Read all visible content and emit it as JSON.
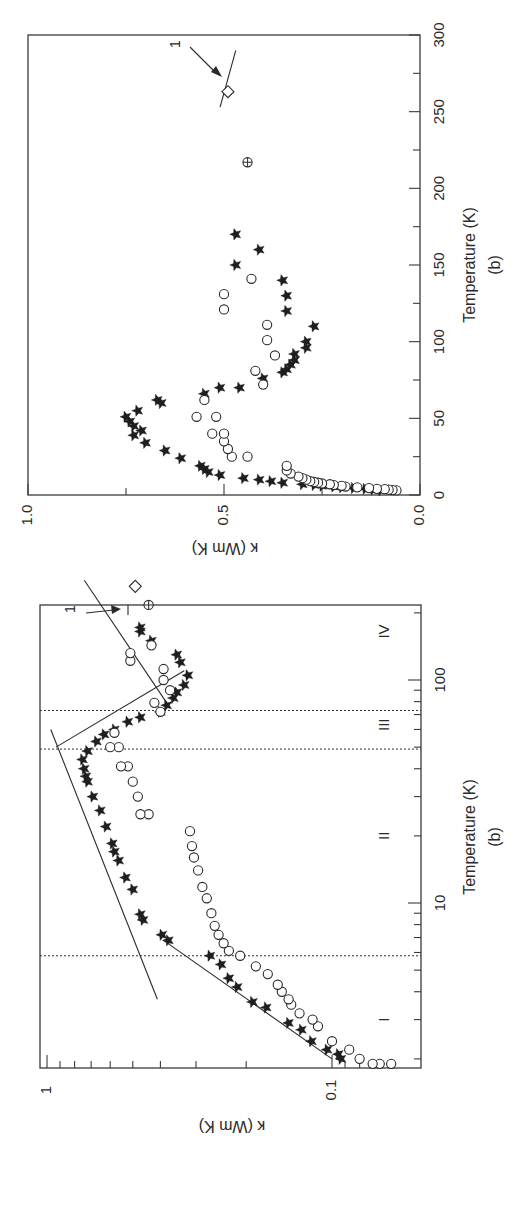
{
  "figure": {
    "orientation": "rotated 90 degrees counter-clockwise",
    "background": "#ffffff",
    "ink": "#2a2a2a"
  },
  "chart_data": [
    {
      "id": "linear-plot",
      "type": "scatter",
      "title": "",
      "panel_label": "(b)",
      "xlabel": "Temperature (K)",
      "ylabel": "κ (Wm K)",
      "xlim": [
        0,
        300
      ],
      "ylim": [
        0.0,
        1.0
      ],
      "x_ticks": [
        0,
        50,
        100,
        150,
        200,
        250,
        300
      ],
      "x_tick_labels": [
        "0",
        "50",
        "100",
        "150",
        "200",
        "250",
        "300"
      ],
      "x_minor_ticks": [
        25,
        75,
        125,
        175,
        225,
        275
      ],
      "y_ticks": [
        0.0,
        0.5,
        1.0
      ],
      "y_tick_labels": [
        "0.0",
        "0.5",
        "1.0"
      ],
      "y_minor_ticks": [
        0.25,
        0.75
      ],
      "grid": false,
      "series": [
        {
          "name": "stars",
          "marker": "filled-star",
          "points": [
            [
              3,
              0.1
            ],
            [
              3.5,
              0.12
            ],
            [
              4,
              0.14
            ],
            [
              4.5,
              0.17
            ],
            [
              5,
              0.2
            ],
            [
              5.5,
              0.22
            ],
            [
              6,
              0.25
            ],
            [
              6.5,
              0.27
            ],
            [
              7,
              0.3
            ],
            [
              8,
              0.35
            ],
            [
              9,
              0.38
            ],
            [
              10,
              0.41
            ],
            [
              11,
              0.45
            ],
            [
              13,
              0.51
            ],
            [
              15,
              0.54
            ],
            [
              17,
              0.55
            ],
            [
              19,
              0.56
            ],
            [
              24,
              0.61
            ],
            [
              29,
              0.65
            ],
            [
              34,
              0.7
            ],
            [
              39,
              0.73
            ],
            [
              42,
              0.71
            ],
            [
              45,
              0.73
            ],
            [
              48,
              0.74
            ],
            [
              51,
              0.75
            ],
            [
              55,
              0.72
            ],
            [
              60,
              0.66
            ],
            [
              62,
              0.67
            ],
            [
              66,
              0.55
            ],
            [
              70,
              0.51
            ],
            [
              70,
              0.46
            ],
            [
              76,
              0.4
            ],
            [
              80,
              0.35
            ],
            [
              82,
              0.34
            ],
            [
              85,
              0.33
            ],
            [
              88,
              0.32
            ],
            [
              92,
              0.32
            ],
            [
              96,
              0.29
            ],
            [
              100,
              0.29
            ],
            [
              110,
              0.27
            ],
            [
              120,
              0.34
            ],
            [
              130,
              0.34
            ],
            [
              140,
              0.35
            ],
            [
              150,
              0.47
            ],
            [
              160,
              0.41
            ],
            [
              170,
              0.47
            ]
          ]
        },
        {
          "name": "open circles",
          "marker": "open-circle",
          "points": [
            [
              3,
              0.06
            ],
            [
              3.2,
              0.07
            ],
            [
              3.5,
              0.08
            ],
            [
              3.8,
              0.09
            ],
            [
              4,
              0.11
            ],
            [
              4.5,
              0.13
            ],
            [
              5,
              0.16
            ],
            [
              5.5,
              0.19
            ],
            [
              6,
              0.2
            ],
            [
              6.5,
              0.22
            ],
            [
              7,
              0.23
            ],
            [
              7.5,
              0.25
            ],
            [
              8,
              0.26
            ],
            [
              8.5,
              0.27
            ],
            [
              9,
              0.28
            ],
            [
              10,
              0.29
            ],
            [
              11,
              0.3
            ],
            [
              12,
              0.31
            ],
            [
              14,
              0.33
            ],
            [
              16,
              0.34
            ],
            [
              19,
              0.34
            ],
            [
              25,
              0.44
            ],
            [
              25,
              0.48
            ],
            [
              30,
              0.49
            ],
            [
              35,
              0.5
            ],
            [
              40,
              0.53
            ],
            [
              40,
              0.5
            ],
            [
              51,
              0.52
            ],
            [
              51,
              0.57
            ],
            [
              62,
              0.55
            ],
            [
              72,
              0.4
            ],
            [
              81,
              0.42
            ],
            [
              91,
              0.37
            ],
            [
              101,
              0.39
            ],
            [
              111,
              0.39
            ],
            [
              121,
              0.5
            ],
            [
              131,
              0.5
            ],
            [
              141,
              0.43
            ]
          ]
        },
        {
          "name": "crossed circle",
          "marker": "circle-plus",
          "points": [
            [
              217,
              0.44
            ]
          ]
        },
        {
          "name": "diamond (1)",
          "marker": "open-diamond",
          "points": [
            [
              263,
              0.49
            ]
          ]
        }
      ],
      "annotations": [
        {
          "text": "1",
          "arrow_to": [
            274,
            0.49
          ],
          "note": "arrow pointing to short line at the diamond"
        }
      ],
      "reference_line": {
        "from": [
          253,
          0.51
        ],
        "to": [
          290,
          0.47
        ]
      }
    },
    {
      "id": "log-plot",
      "type": "scatter",
      "title": "",
      "panel_label": "(b)",
      "xlabel": "Temperature (K)",
      "ylabel": "κ (Wm K)",
      "xscale": "log",
      "yscale": "log",
      "xlim": [
        1.6,
        350
      ],
      "ylim": [
        0.065,
        1.05
      ],
      "x_ticks": [
        10,
        100
      ],
      "x_tick_labels": [
        "10",
        "100"
      ],
      "x_minor_ticks": [
        2,
        3,
        4,
        5,
        6,
        7,
        8,
        9,
        20,
        30,
        40,
        50,
        60,
        70,
        80,
        90,
        200
      ],
      "y_ticks": [
        0.1,
        1
      ],
      "y_tick_labels": [
        "0.1",
        "1"
      ],
      "y_minor_ticks": [
        0.08,
        0.09,
        0.2,
        0.3,
        0.4,
        0.5,
        0.6,
        0.7,
        0.8,
        0.9
      ],
      "grid": false,
      "regions": [
        {
          "label": "I",
          "T_center": 3
        },
        {
          "label": "II",
          "T_center": 20
        },
        {
          "label": "III",
          "T_center": 63
        },
        {
          "label": "IV",
          "T_center": 165
        }
      ],
      "region_boundaries_T": [
        5.8,
        49,
        73
      ],
      "fit_lines": [
        {
          "name": "region I fit",
          "from": [
            2.0,
            0.1
          ],
          "to": [
            6.8,
            0.39
          ]
        },
        {
          "name": "region II fit",
          "from": [
            3.7,
            0.41
          ],
          "to": [
            60,
            0.97
          ]
        },
        {
          "name": "region III fit",
          "from": [
            50,
            0.93
          ],
          "to": [
            110,
            0.33
          ]
        },
        {
          "name": "region IV fit",
          "from": [
            75,
            0.37
          ],
          "to": [
            280,
            0.74
          ]
        }
      ],
      "series": [
        {
          "name": "stars",
          "marker": "filled-star",
          "points": [
            [
              2.0,
              0.093
            ],
            [
              2.1,
              0.095
            ],
            [
              2.2,
              0.104
            ],
            [
              2.4,
              0.118
            ],
            [
              2.7,
              0.128
            ],
            [
              2.9,
              0.142
            ],
            [
              3.4,
              0.17
            ],
            [
              3.6,
              0.19
            ],
            [
              4.2,
              0.215
            ],
            [
              4.6,
              0.23
            ],
            [
              5.3,
              0.245
            ],
            [
              5.8,
              0.268
            ],
            [
              6.8,
              0.375
            ],
            [
              7.2,
              0.395
            ],
            [
              8.4,
              0.46
            ],
            [
              8.9,
              0.47
            ],
            [
              11.5,
              0.5
            ],
            [
              13,
              0.53
            ],
            [
              15.5,
              0.56
            ],
            [
              17,
              0.58
            ],
            [
              18.5,
              0.59
            ],
            [
              22,
              0.62
            ],
            [
              26,
              0.65
            ],
            [
              30,
              0.69
            ],
            [
              35,
              0.72
            ],
            [
              37,
              0.73
            ],
            [
              40,
              0.74
            ],
            [
              44,
              0.75
            ],
            [
              48,
              0.72
            ],
            [
              53,
              0.67
            ],
            [
              57,
              0.63
            ],
            [
              60,
              0.58
            ],
            [
              65,
              0.52
            ],
            [
              68,
              0.47
            ],
            [
              72,
              0.4
            ],
            [
              77,
              0.38
            ],
            [
              83,
              0.36
            ],
            [
              88,
              0.35
            ],
            [
              95,
              0.33
            ],
            [
              105,
              0.32
            ],
            [
              120,
              0.34
            ],
            [
              130,
              0.35
            ],
            [
              150,
              0.43
            ],
            [
              165,
              0.47
            ],
            [
              172,
              0.47
            ]
          ]
        },
        {
          "name": "open circles",
          "marker": "open-circle",
          "points": [
            [
              1.9,
              0.062
            ],
            [
              1.9,
              0.068
            ],
            [
              1.9,
              0.072
            ],
            [
              2.0,
              0.08
            ],
            [
              2.2,
              0.087
            ],
            [
              2.4,
              0.1
            ],
            [
              2.8,
              0.112
            ],
            [
              3.0,
              0.117
            ],
            [
              3.2,
              0.13
            ],
            [
              3.5,
              0.139
            ],
            [
              3.7,
              0.142
            ],
            [
              4.0,
              0.15
            ],
            [
              4.3,
              0.155
            ],
            [
              4.8,
              0.168
            ],
            [
              5.2,
              0.185
            ],
            [
              5.8,
              0.21
            ],
            [
              6.1,
              0.23
            ],
            [
              6.6,
              0.24
            ],
            [
              7.2,
              0.25
            ],
            [
              7.9,
              0.258
            ],
            [
              9,
              0.265
            ],
            [
              10.5,
              0.275
            ],
            [
              11.8,
              0.285
            ],
            [
              14,
              0.295
            ],
            [
              16,
              0.305
            ],
            [
              18,
              0.31
            ],
            [
              21,
              0.315
            ],
            [
              25,
              0.44
            ],
            [
              25,
              0.47
            ],
            [
              30,
              0.48
            ],
            [
              35,
              0.5
            ],
            [
              41,
              0.52
            ],
            [
              41,
              0.55
            ],
            [
              50,
              0.56
            ],
            [
              50,
              0.6
            ],
            [
              58,
              0.58
            ],
            [
              72,
              0.4
            ],
            [
              79,
              0.42
            ],
            [
              90,
              0.37
            ],
            [
              100,
              0.39
            ],
            [
              112,
              0.39
            ],
            [
              122,
              0.51
            ],
            [
              132,
              0.51
            ],
            [
              143,
              0.43
            ]
          ]
        },
        {
          "name": "crossed circle",
          "marker": "circle-plus",
          "points": [
            [
              217,
              0.44
            ]
          ]
        },
        {
          "name": "diamond (1)",
          "marker": "open-diamond",
          "points": [
            [
              263,
              0.49
            ]
          ]
        }
      ],
      "annotations": [
        {
          "text": "1",
          "arrow_to": [
            265,
            0.52
          ]
        }
      ]
    }
  ],
  "labels": {
    "top": {
      "xlabel": "Temperature (K)",
      "panel": "(b)",
      "ylabel": "κ (Wm K)",
      "x_tick_labels": [
        "0",
        "50",
        "100",
        "150",
        "200",
        "250",
        "300"
      ],
      "y_tick_labels": [
        "0.0",
        "0.5",
        "1.0"
      ],
      "annotation": "1"
    },
    "bottom": {
      "xlabel": "Temperature (K)",
      "panel": "(b)",
      "ylabel": "κ (Wm K)",
      "x_tick_labels": [
        "10",
        "100"
      ],
      "y_tick_labels": [
        "0.1",
        "1"
      ],
      "regions": [
        "I",
        "II",
        "III",
        "IV"
      ],
      "annotation": "1"
    }
  }
}
